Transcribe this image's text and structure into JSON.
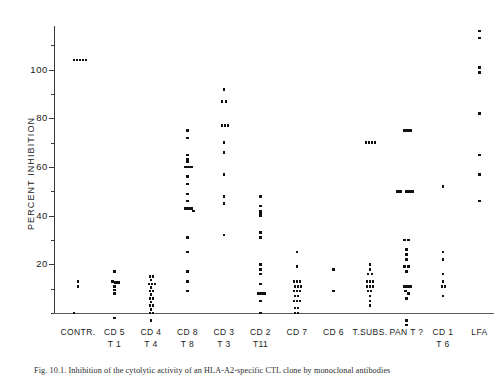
{
  "figure": {
    "caption": "Fig. 10.1. Inhibition of the cytolytic activity of an HLA-A2-specific CTL clone by monoclonal antibodies"
  },
  "axes": {
    "y_title": "PERCENT INHIBITION",
    "y_ticks": [
      20,
      40,
      60,
      80,
      100
    ],
    "y_tick_labels": [
      "20",
      "40",
      "60",
      "80",
      "100"
    ],
    "ylim": [
      -6,
      118
    ],
    "baseline_value": 0
  },
  "chart_data": {
    "type": "scatter",
    "title": "",
    "xlabel": "",
    "ylabel": "PERCENT INHIBITION",
    "ylim": [
      -6,
      118
    ],
    "grid": false,
    "legend": "none",
    "categories": [
      {
        "line1": "CONTR.",
        "line2": ""
      },
      {
        "line1": "CD 5",
        "line2": "T 1"
      },
      {
        "line1": "CD 4",
        "line2": "T 4"
      },
      {
        "line1": "CD 8",
        "line2": "T 8"
      },
      {
        "line1": "CD 3",
        "line2": "T 3"
      },
      {
        "line1": "CD 2",
        "line2": "T11"
      },
      {
        "line1": "CD 7",
        "line2": ""
      },
      {
        "line1": "CD 6",
        "line2": ""
      },
      {
        "line1": "T.SUBS.",
        "line2": ""
      },
      {
        "line1": "PAN T ?",
        "line2": ""
      },
      {
        "line1": "CD 1",
        "line2": "T 6"
      },
      {
        "line1": "LFA",
        "line2": ""
      }
    ],
    "series": [
      {
        "name": "CONTR.",
        "points": [
          {
            "v": 104,
            "o": -4
          },
          {
            "v": 104,
            "o": -1
          },
          {
            "v": 104,
            "o": 2
          },
          {
            "v": 104,
            "o": 5
          },
          {
            "v": 104,
            "o": 8
          },
          {
            "v": 13,
            "o": 0
          },
          {
            "v": 11,
            "o": 0
          },
          {
            "v": 0,
            "o": -4
          }
        ]
      },
      {
        "name": "CD 5 / T 1",
        "points": [
          {
            "v": 17,
            "o": 0
          },
          {
            "v": 13,
            "o": -2
          },
          {
            "v": 12.5,
            "o": 1
          },
          {
            "v": 12.5,
            "o": 4
          },
          {
            "v": 11,
            "o": 0
          },
          {
            "v": 9.5,
            "o": 0
          },
          {
            "v": 8,
            "o": 0
          },
          {
            "v": -2,
            "o": 0
          }
        ]
      },
      {
        "name": "CD 4 / T 4",
        "points": [
          {
            "v": 15,
            "o": -1
          },
          {
            "v": 15,
            "o": 2
          },
          {
            "v": 13.5,
            "o": 0
          },
          {
            "v": 12,
            "o": -2
          },
          {
            "v": 12,
            "o": 1
          },
          {
            "v": 12,
            "o": 4
          },
          {
            "v": 10.5,
            "o": 0
          },
          {
            "v": 9,
            "o": -1
          },
          {
            "v": 9,
            "o": 2
          },
          {
            "v": 7.5,
            "o": 0
          },
          {
            "v": 6,
            "o": -1
          },
          {
            "v": 6,
            "o": 2
          },
          {
            "v": 4.5,
            "o": 0
          },
          {
            "v": 3,
            "o": -1
          },
          {
            "v": 3,
            "o": 2
          },
          {
            "v": 1.5,
            "o": 0
          },
          {
            "v": 0,
            "o": -1
          },
          {
            "v": 0,
            "o": 2
          },
          {
            "v": -3,
            "o": 0
          }
        ]
      },
      {
        "name": "CD 8 / T 8",
        "points": [
          {
            "v": 75,
            "o": 0
          },
          {
            "v": 72,
            "o": 0
          },
          {
            "v": 65,
            "o": 0
          },
          {
            "v": 63,
            "o": 0
          },
          {
            "v": 62,
            "o": 0
          },
          {
            "v": 60,
            "o": -2
          },
          {
            "v": 60,
            "o": 1
          },
          {
            "v": 60,
            "o": 4
          },
          {
            "v": 56,
            "o": 0
          },
          {
            "v": 53,
            "o": 0
          },
          {
            "v": 49,
            "o": 0
          },
          {
            "v": 46,
            "o": 0
          },
          {
            "v": 43,
            "o": -2
          },
          {
            "v": 43,
            "o": 1
          },
          {
            "v": 43,
            "o": 4
          },
          {
            "v": 42,
            "o": 6
          },
          {
            "v": 31,
            "o": 0
          },
          {
            "v": 25,
            "o": 0
          },
          {
            "v": 17,
            "o": 0
          },
          {
            "v": 13,
            "o": 0
          },
          {
            "v": 9,
            "o": 0
          }
        ]
      },
      {
        "name": "CD 3 / T 3",
        "points": [
          {
            "v": 92,
            "o": 0
          },
          {
            "v": 87,
            "o": -2
          },
          {
            "v": 87,
            "o": 2
          },
          {
            "v": 77,
            "o": -2
          },
          {
            "v": 77,
            "o": 1
          },
          {
            "v": 77,
            "o": 4
          },
          {
            "v": 70,
            "o": 0
          },
          {
            "v": 66,
            "o": 0
          },
          {
            "v": 57,
            "o": 0
          },
          {
            "v": 48,
            "o": 0
          },
          {
            "v": 45,
            "o": 0
          },
          {
            "v": 32,
            "o": 0
          }
        ]
      },
      {
        "name": "CD 2 / T11",
        "points": [
          {
            "v": 48,
            "o": 0
          },
          {
            "v": 44,
            "o": 0
          },
          {
            "v": 42,
            "o": 0
          },
          {
            "v": 41,
            "o": 0
          },
          {
            "v": 40,
            "o": 0
          },
          {
            "v": 33,
            "o": 0
          },
          {
            "v": 31,
            "o": 0
          },
          {
            "v": 20,
            "o": 0
          },
          {
            "v": 18,
            "o": 0
          },
          {
            "v": 16,
            "o": 0
          },
          {
            "v": 12,
            "o": 0
          },
          {
            "v": 8,
            "o": -2
          },
          {
            "v": 8,
            "o": 1
          },
          {
            "v": 8,
            "o": 4
          },
          {
            "v": 5,
            "o": 0
          },
          {
            "v": 0,
            "o": 0
          }
        ]
      },
      {
        "name": "CD 7",
        "points": [
          {
            "v": 25,
            "o": 0
          },
          {
            "v": 19,
            "o": 0
          },
          {
            "v": 13,
            "o": -3
          },
          {
            "v": 13,
            "o": 0
          },
          {
            "v": 13,
            "o": 3
          },
          {
            "v": 11,
            "o": -2
          },
          {
            "v": 11,
            "o": 1
          },
          {
            "v": 11,
            "o": 4
          },
          {
            "v": 9,
            "o": -3
          },
          {
            "v": 9,
            "o": 0
          },
          {
            "v": 9,
            "o": 3
          },
          {
            "v": 7,
            "o": -2
          },
          {
            "v": 7,
            "o": 1
          },
          {
            "v": 5,
            "o": -3
          },
          {
            "v": 5,
            "o": 0
          },
          {
            "v": 5,
            "o": 3
          },
          {
            "v": 2,
            "o": -2
          },
          {
            "v": 2,
            "o": 1
          },
          {
            "v": 0,
            "o": -2
          },
          {
            "v": 0,
            "o": 1
          }
        ]
      },
      {
        "name": "CD 6",
        "points": [
          {
            "v": 18,
            "o": 0
          },
          {
            "v": 9,
            "o": 0
          }
        ]
      },
      {
        "name": "T.SUBS.",
        "points": [
          {
            "v": 70,
            "o": -4
          },
          {
            "v": 70,
            "o": -1
          },
          {
            "v": 70,
            "o": 2
          },
          {
            "v": 70,
            "o": 5
          },
          {
            "v": 20,
            "o": 0
          },
          {
            "v": 18,
            "o": 0
          },
          {
            "v": 16,
            "o": -2
          },
          {
            "v": 16,
            "o": 2
          },
          {
            "v": 13,
            "o": -3
          },
          {
            "v": 13,
            "o": 0
          },
          {
            "v": 13,
            "o": 3
          },
          {
            "v": 11,
            "o": -3
          },
          {
            "v": 11,
            "o": 0
          },
          {
            "v": 11,
            "o": 3
          },
          {
            "v": 9,
            "o": -2
          },
          {
            "v": 9,
            "o": 1
          },
          {
            "v": 7,
            "o": 0
          },
          {
            "v": 5,
            "o": 0
          },
          {
            "v": 3,
            "o": 0
          }
        ]
      },
      {
        "name": "PAN T ?",
        "points": [
          {
            "v": 75,
            "o": -2
          },
          {
            "v": 75,
            "o": 1
          },
          {
            "v": 75,
            "o": 4
          },
          {
            "v": 50,
            "o": -9
          },
          {
            "v": 50,
            "o": -6
          },
          {
            "v": 50,
            "o": 0
          },
          {
            "v": 50,
            "o": 3
          },
          {
            "v": 50,
            "o": 6
          },
          {
            "v": 30,
            "o": -2
          },
          {
            "v": 30,
            "o": 2
          },
          {
            "v": 26,
            "o": 0
          },
          {
            "v": 24,
            "o": 0
          },
          {
            "v": 22,
            "o": 0
          },
          {
            "v": 19,
            "o": -2
          },
          {
            "v": 19,
            "o": 2
          },
          {
            "v": 17,
            "o": 0
          },
          {
            "v": 11,
            "o": -2
          },
          {
            "v": 11,
            "o": 1
          },
          {
            "v": 11,
            "o": 4
          },
          {
            "v": 9,
            "o": -1
          },
          {
            "v": 8,
            "o": 2
          },
          {
            "v": 6,
            "o": 0
          },
          {
            "v": -3,
            "o": 0
          },
          {
            "v": -5,
            "o": 0
          }
        ]
      },
      {
        "name": "CD 1 / T 6",
        "points": [
          {
            "v": 52,
            "o": 0
          },
          {
            "v": 25,
            "o": 0
          },
          {
            "v": 22,
            "o": 0
          },
          {
            "v": 16,
            "o": 0
          },
          {
            "v": 13,
            "o": 0
          },
          {
            "v": 11,
            "o": -1
          },
          {
            "v": 11,
            "o": 2
          },
          {
            "v": 7,
            "o": 0
          }
        ]
      },
      {
        "name": "LFA",
        "points": [
          {
            "v": 116,
            "o": 0
          },
          {
            "v": 113,
            "o": 0
          },
          {
            "v": 101,
            "o": 0
          },
          {
            "v": 99,
            "o": 0
          },
          {
            "v": 82,
            "o": 0
          },
          {
            "v": 65,
            "o": 0
          },
          {
            "v": 57,
            "o": 0
          },
          {
            "v": 46,
            "o": 0
          }
        ]
      }
    ]
  }
}
